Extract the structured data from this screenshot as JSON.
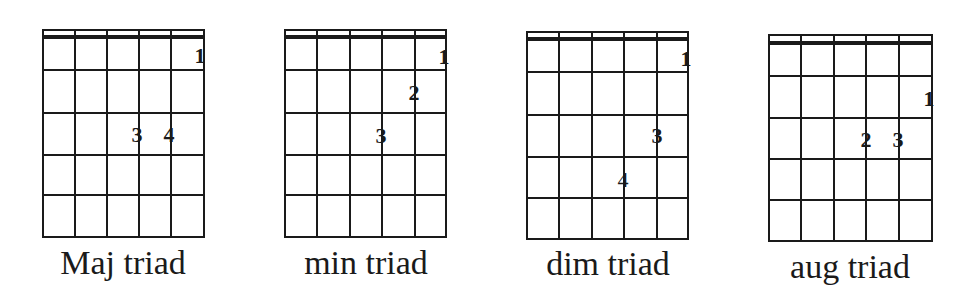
{
  "colors": {
    "ink": "#1a1a1a",
    "background": "#ffffff"
  },
  "diagrams": [
    {
      "label": "Maj triad",
      "strings": 6,
      "frets": 5,
      "fingers": [
        {
          "finger": "1",
          "string": 6,
          "fret": 1
        },
        {
          "finger": "3",
          "string": 4,
          "fret": 3
        },
        {
          "finger": "4",
          "string": 5,
          "fret": 3
        }
      ]
    },
    {
      "label": "min triad",
      "strings": 6,
      "frets": 5,
      "fingers": [
        {
          "finger": "1",
          "string": 6,
          "fret": 1
        },
        {
          "finger": "2",
          "string": 5,
          "fret": 2
        },
        {
          "finger": "3",
          "string": 4,
          "fret": 3
        }
      ]
    },
    {
      "label": "dim triad",
      "strings": 6,
      "frets": 5,
      "fingers": [
        {
          "finger": "1",
          "string": 6,
          "fret": 1
        },
        {
          "finger": "3",
          "string": 5,
          "fret": 3
        },
        {
          "finger": "4",
          "string": 4,
          "fret": 4
        }
      ]
    },
    {
      "label": "aug triad",
      "strings": 6,
      "frets": 5,
      "fingers": [
        {
          "finger": "1",
          "string": 6,
          "fret": 2
        },
        {
          "finger": "2",
          "string": 4,
          "fret": 3
        },
        {
          "finger": "3",
          "string": 5,
          "fret": 3
        }
      ]
    }
  ]
}
